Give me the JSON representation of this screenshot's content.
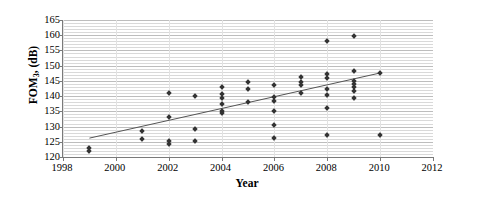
{
  "chart_data": {
    "type": "scatter",
    "title": "",
    "xlabel": "Year",
    "ylabel": "FOM3, (dB)",
    "ylabel_base": "FOM",
    "ylabel_sub": "3",
    "ylabel_suffix": ", (dB)",
    "xlim": [
      1998,
      2012
    ],
    "ylim": [
      120,
      165
    ],
    "x_ticks": [
      1998,
      2000,
      2002,
      2004,
      2006,
      2008,
      2010,
      2012
    ],
    "y_ticks": [
      120,
      125,
      130,
      135,
      140,
      145,
      150,
      155,
      160,
      165
    ],
    "y_minor_step": 1,
    "grid": "horizontal-major-and-minor",
    "legend": "none",
    "marker": "diamond",
    "marker_color": "#333333",
    "trendline": {
      "type": "linear",
      "x_start": 1999,
      "y_start": 126.2,
      "x_end": 2010,
      "y_end": 147.6,
      "color": "#555555"
    },
    "points": [
      {
        "x": 1999,
        "y": 122.9
      },
      {
        "x": 1999,
        "y": 122.1
      },
      {
        "x": 2001,
        "y": 128.6
      },
      {
        "x": 2001,
        "y": 125.9
      },
      {
        "x": 2002,
        "y": 141.0
      },
      {
        "x": 2002,
        "y": 133.0
      },
      {
        "x": 2002,
        "y": 125.1
      },
      {
        "x": 2002,
        "y": 124.3
      },
      {
        "x": 2003,
        "y": 140.1
      },
      {
        "x": 2003,
        "y": 129.2
      },
      {
        "x": 2003,
        "y": 125.4
      },
      {
        "x": 2004,
        "y": 142.9
      },
      {
        "x": 2004,
        "y": 140.8
      },
      {
        "x": 2004,
        "y": 139.5
      },
      {
        "x": 2004,
        "y": 137.3
      },
      {
        "x": 2004,
        "y": 135.2
      },
      {
        "x": 2004,
        "y": 134.4
      },
      {
        "x": 2005,
        "y": 144.6
      },
      {
        "x": 2005,
        "y": 142.3
      },
      {
        "x": 2005,
        "y": 138.0
      },
      {
        "x": 2006,
        "y": 143.7
      },
      {
        "x": 2006,
        "y": 139.6
      },
      {
        "x": 2006,
        "y": 138.4
      },
      {
        "x": 2006,
        "y": 135.2
      },
      {
        "x": 2006,
        "y": 130.6
      },
      {
        "x": 2006,
        "y": 126.3
      },
      {
        "x": 2007,
        "y": 146.3
      },
      {
        "x": 2007,
        "y": 144.6
      },
      {
        "x": 2007,
        "y": 143.8
      },
      {
        "x": 2007,
        "y": 141.1
      },
      {
        "x": 2008,
        "y": 158.0
      },
      {
        "x": 2008,
        "y": 147.2
      },
      {
        "x": 2008,
        "y": 146.0
      },
      {
        "x": 2008,
        "y": 142.3
      },
      {
        "x": 2008,
        "y": 140.4
      },
      {
        "x": 2008,
        "y": 136.0
      },
      {
        "x": 2008,
        "y": 127.2
      },
      {
        "x": 2009,
        "y": 159.6
      },
      {
        "x": 2009,
        "y": 148.2
      },
      {
        "x": 2009,
        "y": 145.0
      },
      {
        "x": 2009,
        "y": 143.9
      },
      {
        "x": 2009,
        "y": 142.9
      },
      {
        "x": 2009,
        "y": 141.6
      },
      {
        "x": 2009,
        "y": 139.4
      },
      {
        "x": 2010,
        "y": 147.6
      },
      {
        "x": 2010,
        "y": 127.3
      }
    ]
  },
  "axes": {
    "x_tick_labels": [
      "1998",
      "2000",
      "2002",
      "2004",
      "2006",
      "2008",
      "2010",
      "2012"
    ],
    "y_tick_labels": [
      "165",
      "160",
      "155",
      "150",
      "145",
      "140",
      "135",
      "130",
      "125",
      "120"
    ],
    "x_title": "Year",
    "y_title_base": "FOM",
    "y_title_sub": "3",
    "y_title_suffix": ", (dB)"
  }
}
